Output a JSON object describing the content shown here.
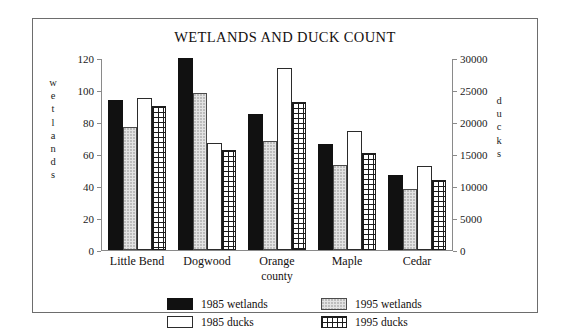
{
  "figure": {
    "title": "WETLANDS AND DUCK COUNT",
    "xaxis_title": "county",
    "left_axis_caption": "wetlands",
    "right_axis_caption": "ducks"
  },
  "axes": {
    "left_ticks": [
      "0",
      "20",
      "40",
      "60",
      "80",
      "100",
      "120"
    ],
    "right_ticks": [
      "0",
      "5000",
      "10000",
      "15000",
      "20000",
      "25000",
      "30000"
    ]
  },
  "legend": {
    "items": [
      {
        "label": "1985 wetlands",
        "swatch": "solid-black",
        "color": "#111111"
      },
      {
        "label": "1995 wetlands",
        "swatch": "light-dotted",
        "color": "#e3e3e3"
      },
      {
        "label": "1985 ducks",
        "swatch": "open-white",
        "color": "#ffffff"
      },
      {
        "label": "1995 ducks",
        "swatch": "crosshatch-grid",
        "color": "#1c1c1c"
      }
    ]
  },
  "chart_data": {
    "type": "bar",
    "title": "WETLANDS AND DUCK COUNT",
    "xlabel": "county",
    "ylabel": "wetlands",
    "y2label": "ducks",
    "ylim": [
      0,
      120
    ],
    "y2lim": [
      0,
      30000
    ],
    "yticks": [
      0,
      20,
      40,
      60,
      80,
      100,
      120
    ],
    "y2ticks": [
      0,
      5000,
      10000,
      15000,
      20000,
      25000,
      30000
    ],
    "grid": false,
    "legend_position": "bottom",
    "categories": [
      "Little Bend",
      "Dogwood",
      "Orange",
      "Maple",
      "Cedar"
    ],
    "series": [
      {
        "name": "1985 wetlands",
        "axis": "left",
        "unit": "wetlands",
        "values": [
          94,
          120,
          85,
          66,
          47
        ]
      },
      {
        "name": "1995 wetlands",
        "axis": "left",
        "unit": "wetlands",
        "values": [
          77,
          98,
          68,
          53,
          38
        ]
      },
      {
        "name": "1985 ducks",
        "axis": "right",
        "unit": "ducks",
        "values": [
          23800,
          16750,
          28500,
          18600,
          13200
        ]
      },
      {
        "name": "1995 ducks",
        "axis": "right",
        "unit": "ducks",
        "values": [
          22500,
          15700,
          23200,
          15100,
          11000
        ]
      }
    ]
  }
}
